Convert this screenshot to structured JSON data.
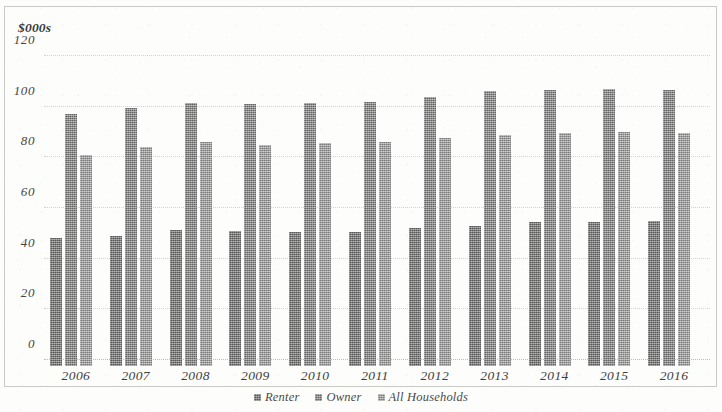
{
  "chart_data": {
    "type": "bar",
    "title": "",
    "subtitle": "",
    "xlabel": "",
    "ylabel": "$000s",
    "ylim": [
      0,
      120
    ],
    "yticks": [
      0,
      20,
      40,
      60,
      80,
      100,
      120
    ],
    "ytick_labels": [
      "0",
      "20",
      "40",
      "60",
      "80",
      "100",
      "120"
    ],
    "grid": true,
    "legend_position": "bottom-center",
    "categories": [
      "2006",
      "2007",
      "2008",
      "2009",
      "2010",
      "2011",
      "2012",
      "2013",
      "2014",
      "2015",
      "2016"
    ],
    "series": [
      {
        "name": "Renter",
        "color": "#6f6f6f",
        "values": [
          48,
          49,
          51.5,
          51,
          50.5,
          50.5,
          52,
          53,
          54.5,
          54.5,
          55
        ]
      },
      {
        "name": "Owner",
        "color": "#7d7d7d",
        "values": [
          97,
          99.5,
          101.5,
          101,
          101.5,
          102,
          104,
          106,
          106.5,
          107,
          106.5
        ]
      },
      {
        "name": "All Households",
        "color": "#919191",
        "values": [
          81,
          84,
          86,
          85,
          85.5,
          86,
          87.5,
          89,
          89.5,
          90,
          89.5
        ]
      }
    ]
  },
  "axis": {
    "unit_label": "$000s"
  },
  "legend": {
    "items": [
      {
        "label": "Renter"
      },
      {
        "label": "Owner"
      },
      {
        "label": "All Households"
      }
    ]
  }
}
